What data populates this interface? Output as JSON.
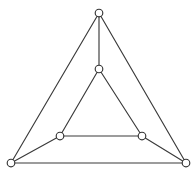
{
  "figure": {
    "kind": "graph-diagram",
    "background_color": "#ffffff",
    "edge_color": "#3a3a3a",
    "vertex_fill_color": "#ffffff",
    "vertex_stroke_color": "#333333",
    "edge_width": 1.15,
    "vertex_radius": 3.8,
    "canvas": {
      "width": 196,
      "height": 177
    }
  },
  "chart_data": {
    "type": "scatter",
    "xlabel": "",
    "ylabel": "",
    "xlim": [
      0,
      196
    ],
    "ylim": [
      0,
      177
    ],
    "grid": false,
    "legend": "none",
    "vertex_count": 6,
    "edge_count": 9,
    "nodes": [
      {
        "id": "outer-top",
        "label": "",
        "x": 99,
        "y": 13
      },
      {
        "id": "outer-bottom-left",
        "label": "",
        "x": 11,
        "y": 163
      },
      {
        "id": "outer-bottom-right",
        "label": "",
        "x": 186,
        "y": 163
      },
      {
        "id": "inner-top",
        "label": "",
        "x": 99,
        "y": 69
      },
      {
        "id": "inner-bottom-left",
        "label": "",
        "x": 60,
        "y": 136
      },
      {
        "id": "inner-bottom-right",
        "label": "",
        "x": 142,
        "y": 136
      }
    ],
    "edges": [
      {
        "id": "outer-left-side",
        "from": "outer-top",
        "to": "outer-bottom-left",
        "x1": 99,
        "y1": 13,
        "x2": 11,
        "y2": 163
      },
      {
        "id": "outer-right-side",
        "from": "outer-top",
        "to": "outer-bottom-right",
        "x1": 99,
        "y1": 13,
        "x2": 186,
        "y2": 163
      },
      {
        "id": "outer-bottom-side",
        "from": "outer-bottom-left",
        "to": "outer-bottom-right",
        "x1": 11,
        "y1": 163,
        "x2": 186,
        "y2": 163
      },
      {
        "id": "inner-left-side",
        "from": "inner-top",
        "to": "inner-bottom-left",
        "x1": 99,
        "y1": 69,
        "x2": 60,
        "y2": 136
      },
      {
        "id": "inner-right-side",
        "from": "inner-top",
        "to": "inner-bottom-right",
        "x1": 99,
        "y1": 69,
        "x2": 142,
        "y2": 136
      },
      {
        "id": "inner-bottom-side",
        "from": "inner-bottom-left",
        "to": "inner-bottom-right",
        "x1": 60,
        "y1": 136,
        "x2": 142,
        "y2": 136
      },
      {
        "id": "spoke-top",
        "from": "outer-top",
        "to": "inner-top",
        "x1": 99,
        "y1": 13,
        "x2": 99,
        "y2": 69
      },
      {
        "id": "spoke-bottom-left",
        "from": "outer-bottom-left",
        "to": "inner-bottom-left",
        "x1": 11,
        "y1": 163,
        "x2": 60,
        "y2": 136
      },
      {
        "id": "spoke-bottom-right",
        "from": "outer-bottom-right",
        "to": "inner-bottom-right",
        "x1": 186,
        "y1": 163,
        "x2": 142,
        "y2": 136
      }
    ]
  }
}
